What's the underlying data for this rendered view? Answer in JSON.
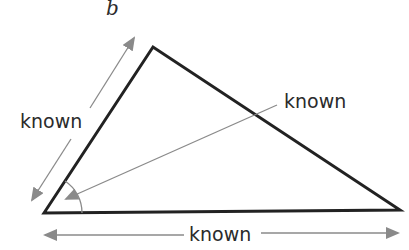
{
  "diagram": {
    "title_label": "b",
    "labels": {
      "left_side": "known",
      "angle": "known",
      "bottom_side": "known"
    },
    "colors": {
      "triangle_stroke": "#222222",
      "arrow": "#8a8a8a",
      "text": "#2b2b2b",
      "background": "#ffffff"
    },
    "triangle": {
      "vertices": [
        [
          44,
          213
        ],
        [
          153,
          47
        ],
        [
          400,
          210
        ]
      ]
    }
  }
}
